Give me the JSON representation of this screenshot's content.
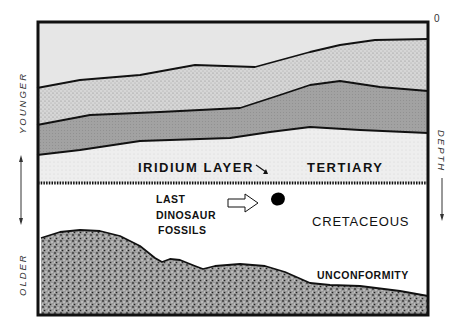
{
  "diagram": {
    "type": "geologic-cross-section",
    "labels": {
      "iridium_layer": "IRIDIUM LAYER",
      "tertiary": "TERTIARY",
      "last": "LAST",
      "dinosaur": "DINOSAUR",
      "fossils": "FOSSILS",
      "cretaceous": "CRETACEOUS",
      "unconformity": "UNCONFORMITY"
    },
    "axes": {
      "left_top": "YOUNGER",
      "left_bottom": "OLDER",
      "right_label": "DEPTH",
      "right_zero": "0"
    },
    "layers": [
      {
        "name": "top-stratum",
        "fill": "#e6e6e6"
      },
      {
        "name": "stippled-stratum",
        "fill": "#d2d2d2"
      },
      {
        "name": "dark-stratum",
        "fill": "#a4a4a4"
      },
      {
        "name": "tertiary-stratum",
        "fill": "#eeeeee"
      },
      {
        "name": "cretaceous-stratum",
        "fill": "#ffffff"
      },
      {
        "name": "basement-rock",
        "fill": "#8a8a8a"
      }
    ],
    "colors": {
      "outline": "#111111",
      "background": "#ffffff"
    }
  }
}
